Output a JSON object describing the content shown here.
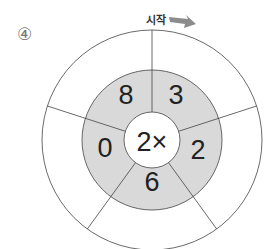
{
  "problem_number": "④",
  "start_label": "시작",
  "center_label": "2×",
  "sectors": [
    {
      "position": "top-right",
      "value": "3"
    },
    {
      "position": "right",
      "value": "2"
    },
    {
      "position": "bottom",
      "value": "6"
    },
    {
      "position": "left",
      "value": "0"
    },
    {
      "position": "top-left",
      "value": "8"
    }
  ],
  "colors": {
    "ring_fill": "#d9d9d9",
    "stroke": "#444444",
    "arrow": "#8c8c8c"
  }
}
